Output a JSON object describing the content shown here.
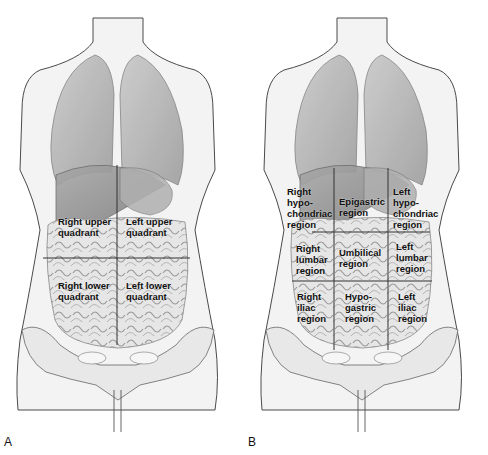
{
  "figure": {
    "panels": [
      {
        "letter": "A",
        "title": "Four abdominal quadrants",
        "regions": [
          {
            "label": "Right upper\nquadrant"
          },
          {
            "label": "Left upper\nquadrant"
          },
          {
            "label": "Right lower\nquadrant"
          },
          {
            "label": "Left lower\nquadrant"
          }
        ]
      },
      {
        "letter": "B",
        "title": "Nine abdominal regions",
        "regions": [
          {
            "label": "Right\nhypo-\nchondriac\nregion"
          },
          {
            "label": "Epigastric\nregion"
          },
          {
            "label": "Left\nhypo-\nchondriac\nregion"
          },
          {
            "label": "Right\nlumbar\nregion"
          },
          {
            "label": "Umbilical\nregion"
          },
          {
            "label": "Left\nlumbar\nregion"
          },
          {
            "label": "Right\niliac\nregion"
          },
          {
            "label": "Hypo-\ngastric\nregion"
          },
          {
            "label": "Left\niliac\nregion"
          }
        ]
      }
    ],
    "colors": {
      "skin": "#f2f2f2",
      "outline": "#555555",
      "organ": "#b8b8b8",
      "grid_line": "#333333",
      "text": "#111111"
    }
  }
}
